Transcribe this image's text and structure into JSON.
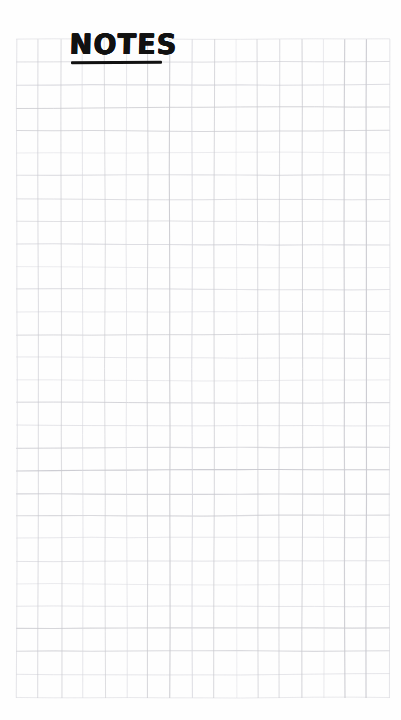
{
  "page": {
    "kind": "grid-notepad-page",
    "width": 401,
    "height": 720,
    "background_color": "#fefefe"
  },
  "header": {
    "title": "NOTES",
    "title_color": "#111111",
    "underline_color": "#111111",
    "style": "hand-lettered-marker-uppercase",
    "underlined": true
  },
  "grid": {
    "line_color": "#c9c9cf",
    "line_color_light": "#d8d8de",
    "cell_size_px": 22.4,
    "columns": 17,
    "rows": 29,
    "origin_x": 17,
    "origin_y": 40,
    "right_edge": 389,
    "bottom_edge": 697,
    "style": "hand-drawn-wobbly-pencil"
  },
  "content": {
    "notes": [],
    "empty_state": ""
  }
}
